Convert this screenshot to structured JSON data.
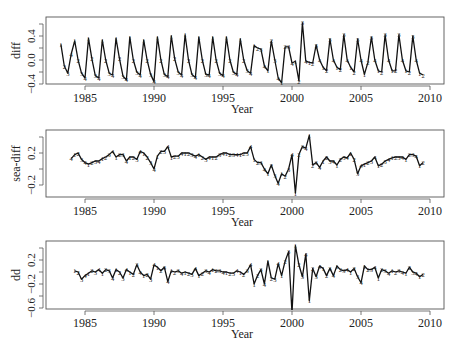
{
  "chart_data": [
    {
      "type": "line",
      "title": "",
      "xlabel": "Year",
      "ylabel": "diff",
      "xlim": [
        1983.0,
        2011.0
      ],
      "ylim": [
        -0.42,
        0.52
      ],
      "xticks": [
        1985,
        1990,
        1995,
        2000,
        2005,
        2010
      ],
      "yticks": [
        -0.4,
        0.0,
        0.4
      ],
      "ytick_labels": [
        "-0.4",
        "0.0",
        "0.4"
      ],
      "grid": false,
      "point_symbol": "quarter number (1-4)",
      "series": [
        {
          "name": "diff",
          "x": [
            1983.25,
            1983.5,
            1983.75,
            1984.0,
            1984.25,
            1984.5,
            1984.75,
            1985.0,
            1985.25,
            1985.5,
            1985.75,
            1986.0,
            1986.25,
            1986.5,
            1986.75,
            1987.0,
            1987.25,
            1987.5,
            1987.75,
            1988.0,
            1988.25,
            1988.5,
            1988.75,
            1989.0,
            1989.25,
            1989.5,
            1989.75,
            1990.0,
            1990.25,
            1990.5,
            1990.75,
            1991.0,
            1991.25,
            1991.5,
            1991.75,
            1992.0,
            1992.25,
            1992.5,
            1992.75,
            1993.0,
            1993.25,
            1993.5,
            1993.75,
            1994.0,
            1994.25,
            1994.5,
            1994.75,
            1995.0,
            1995.25,
            1995.5,
            1995.75,
            1996.0,
            1996.25,
            1996.5,
            1996.75,
            1997.0,
            1997.25,
            1997.5,
            1997.75,
            1998.0,
            1998.25,
            1998.5,
            1998.75,
            1999.0,
            1999.25,
            1999.5,
            1999.75,
            2000.0,
            2000.25,
            2000.5,
            2000.75,
            2001.0,
            2001.25,
            2001.5,
            2001.75,
            2002.0,
            2002.25,
            2002.5,
            2002.75,
            2003.0,
            2003.25,
            2003.5,
            2003.75,
            2004.0,
            2004.25,
            2004.5,
            2004.75,
            2005.0,
            2005.25,
            2005.5,
            2005.75,
            2006.0,
            2006.25,
            2006.5,
            2006.75,
            2007.0,
            2007.25,
            2007.5,
            2007.75,
            2008.0,
            2008.25,
            2008.5,
            2008.75,
            2009.0,
            2009.25,
            2009.5
          ],
          "values": [
            0.26,
            -0.1,
            -0.22,
            0.1,
            0.32,
            0.0,
            -0.22,
            -0.3,
            0.36,
            0.02,
            -0.26,
            -0.3,
            0.33,
            0.0,
            -0.22,
            -0.25,
            0.36,
            0.02,
            -0.27,
            -0.33,
            0.38,
            0.0,
            -0.2,
            -0.25,
            0.33,
            0.0,
            -0.24,
            -0.36,
            0.38,
            0.0,
            -0.24,
            -0.28,
            0.4,
            0.02,
            -0.2,
            -0.25,
            0.42,
            0.0,
            -0.24,
            -0.29,
            0.38,
            0.0,
            -0.24,
            -0.25,
            0.38,
            0.0,
            -0.22,
            -0.26,
            0.38,
            0.0,
            -0.2,
            -0.24,
            0.35,
            0.0,
            -0.18,
            -0.22,
            0.24,
            0.2,
            0.18,
            -0.1,
            -0.18,
            0.32,
            0.0,
            -0.3,
            -0.38,
            0.22,
            0.22,
            -0.05,
            -0.02,
            -0.35,
            0.62,
            -0.02,
            -0.04,
            -0.05,
            0.25,
            0.0,
            -0.12,
            -0.18,
            0.35,
            0.0,
            -0.12,
            -0.16,
            0.42,
            0.0,
            -0.12,
            -0.2,
            0.35,
            0.0,
            -0.24,
            -0.04,
            0.38,
            0.0,
            -0.18,
            -0.2,
            0.42,
            0.0,
            -0.18,
            -0.18,
            0.42,
            0.0,
            -0.18,
            -0.2,
            0.4,
            0.0,
            -0.22,
            -0.25,
            0.36,
            -0.1
          ]
        }
      ]
    },
    {
      "type": "line",
      "title": "",
      "xlabel": "Year",
      "ylabel": "sea-diff",
      "xlim": [
        1983.0,
        2011.0
      ],
      "ylim": [
        -0.33,
        0.47
      ],
      "xticks": [
        1985,
        1990,
        1995,
        2000,
        2005,
        2010
      ],
      "yticks": [
        -0.2,
        0.2
      ],
      "ytick_labels": [
        "-0.2",
        "0.2"
      ],
      "grid": false,
      "point_symbol": "quarter number (1-4)",
      "series": [
        {
          "name": "sea-diff",
          "x": [
            1984.0,
            1984.25,
            1984.5,
            1984.75,
            1985.0,
            1985.25,
            1985.5,
            1985.75,
            1986.0,
            1986.25,
            1986.5,
            1986.75,
            1987.0,
            1987.25,
            1987.5,
            1987.75,
            1988.0,
            1988.25,
            1988.5,
            1988.75,
            1989.0,
            1989.25,
            1989.5,
            1989.75,
            1990.0,
            1990.25,
            1990.5,
            1990.75,
            1991.0,
            1991.25,
            1991.5,
            1991.75,
            1992.0,
            1992.25,
            1992.5,
            1992.75,
            1993.0,
            1993.25,
            1993.5,
            1993.75,
            1994.0,
            1994.25,
            1994.5,
            1994.75,
            1995.0,
            1995.25,
            1995.5,
            1995.75,
            1996.0,
            1996.25,
            1996.5,
            1996.75,
            1997.0,
            1997.25,
            1997.5,
            1997.75,
            1998.0,
            1998.25,
            1998.5,
            1998.75,
            1999.0,
            1999.25,
            1999.5,
            1999.75,
            2000.0,
            2000.25,
            2000.5,
            2000.75,
            2001.0,
            2001.25,
            2001.5,
            2001.75,
            2002.0,
            2002.25,
            2002.5,
            2002.75,
            2003.0,
            2003.25,
            2003.5,
            2003.75,
            2004.0,
            2004.25,
            2004.5,
            2004.75,
            2005.0,
            2005.25,
            2005.5,
            2005.75,
            2006.0,
            2006.25,
            2006.5,
            2006.75,
            2007.0,
            2007.25,
            2007.5,
            2007.75,
            2008.0,
            2008.25,
            2008.5,
            2008.75,
            2009.0,
            2009.25,
            2009.5
          ],
          "values": [
            0.13,
            0.18,
            0.2,
            0.12,
            0.08,
            0.06,
            0.08,
            0.1,
            0.1,
            0.13,
            0.15,
            0.18,
            0.22,
            0.15,
            0.18,
            0.18,
            0.1,
            0.15,
            0.15,
            0.12,
            0.22,
            0.2,
            0.15,
            0.08,
            0.0,
            0.16,
            0.22,
            0.22,
            0.28,
            0.15,
            0.16,
            0.16,
            0.2,
            0.2,
            0.2,
            0.18,
            0.16,
            0.18,
            0.15,
            0.12,
            0.15,
            0.15,
            0.15,
            0.18,
            0.2,
            0.2,
            0.18,
            0.18,
            0.18,
            0.18,
            0.2,
            0.2,
            0.28,
            0.12,
            0.08,
            0.08,
            0.0,
            -0.06,
            0.05,
            -0.08,
            -0.18,
            -0.06,
            -0.09,
            0.0,
            0.18,
            -0.3,
            0.18,
            0.28,
            0.26,
            0.42,
            0.05,
            0.08,
            0.02,
            0.1,
            0.15,
            0.1,
            0.1,
            0.05,
            0.12,
            0.15,
            0.14,
            0.2,
            0.12,
            -0.06,
            0.04,
            0.06,
            0.08,
            0.1,
            0.15,
            0.04,
            0.06,
            0.1,
            0.12,
            0.14,
            0.15,
            0.15,
            0.15,
            0.12,
            0.18,
            0.18,
            0.16,
            0.04,
            0.08
          ]
        }
      ]
    },
    {
      "type": "line",
      "title": "",
      "xlabel": "Year",
      "ylabel": "dd",
      "xlim": [
        1983.0,
        2011.0
      ],
      "ylim": [
        -0.68,
        0.46
      ],
      "xticks": [
        1985,
        1990,
        1995,
        2000,
        2005,
        2010
      ],
      "yticks": [
        -0.6,
        -0.2,
        0.2
      ],
      "ytick_labels": [
        "-0.6",
        "-0.2",
        "0.2"
      ],
      "grid": false,
      "point_symbol": "quarter number (1-4)",
      "series": [
        {
          "name": "dd",
          "x": [
            1984.25,
            1984.5,
            1984.75,
            1985.0,
            1985.25,
            1985.5,
            1985.75,
            1986.0,
            1986.25,
            1986.5,
            1986.75,
            1987.0,
            1987.25,
            1987.5,
            1987.75,
            1988.0,
            1988.25,
            1988.5,
            1988.75,
            1989.0,
            1989.25,
            1989.5,
            1989.75,
            1990.0,
            1990.25,
            1990.5,
            1990.75,
            1991.0,
            1991.25,
            1991.5,
            1991.75,
            1992.0,
            1992.25,
            1992.5,
            1992.75,
            1993.0,
            1993.25,
            1993.5,
            1993.75,
            1994.0,
            1994.25,
            1994.5,
            1994.75,
            1995.0,
            1995.25,
            1995.5,
            1995.75,
            1996.0,
            1996.25,
            1996.5,
            1996.75,
            1997.0,
            1997.25,
            1997.5,
            1997.75,
            1998.0,
            1998.25,
            1998.5,
            1998.75,
            1999.0,
            1999.25,
            1999.5,
            1999.75,
            2000.0,
            2000.25,
            2000.5,
            2000.75,
            2001.0,
            2001.25,
            2001.5,
            2001.75,
            2002.0,
            2002.25,
            2002.5,
            2002.75,
            2003.0,
            2003.25,
            2003.5,
            2003.75,
            2004.0,
            2004.25,
            2004.5,
            2004.75,
            2005.0,
            2005.25,
            2005.5,
            2005.75,
            2006.0,
            2006.25,
            2006.5,
            2006.75,
            2007.0,
            2007.25,
            2007.5,
            2007.75,
            2008.0,
            2008.25,
            2008.5,
            2008.75,
            2009.0,
            2009.25,
            2009.5
          ],
          "values": [
            0.02,
            0.0,
            -0.12,
            -0.06,
            -0.02,
            0.02,
            0.0,
            0.04,
            -0.02,
            0.04,
            0.02,
            -0.1,
            0.04,
            0.0,
            -0.1,
            0.04,
            0.0,
            -0.04,
            0.12,
            0.0,
            -0.06,
            -0.04,
            -0.12,
            0.12,
            0.08,
            0.02,
            0.08,
            -0.16,
            0.02,
            0.0,
            0.02,
            -0.02,
            0.0,
            -0.02,
            -0.04,
            0.06,
            -0.06,
            -0.02,
            0.02,
            0.0,
            0.04,
            0.02,
            0.02,
            0.0,
            0.0,
            -0.02,
            -0.02,
            0.02,
            0.0,
            -0.04,
            0.02,
            0.12,
            -0.2,
            -0.06,
            0.04,
            -0.2,
            0.18,
            -0.1,
            -0.12,
            0.14,
            -0.06,
            0.18,
            0.34,
            -0.68,
            0.44,
            0.12,
            -0.08,
            0.3,
            -0.48,
            0.06,
            -0.08,
            0.1,
            0.06,
            -0.06,
            0.06,
            -0.06,
            0.1,
            0.04,
            0.02,
            0.04,
            0.0,
            0.06,
            -0.08,
            -0.18,
            0.1,
            0.04,
            0.04,
            0.08,
            -0.1,
            0.04,
            0.02,
            -0.02,
            0.02,
            0.0,
            0.02,
            0.0,
            -0.02,
            0.08,
            0.0,
            -0.02,
            -0.08,
            -0.04,
            0.12
          ]
        }
      ]
    }
  ],
  "panels": [
    {
      "name": "diff",
      "ylabel": "diff",
      "xlabel": "Year",
      "box": {
        "x0": 46,
        "x1": 444,
        "y0": 17,
        "y1": 84
      },
      "axis_y": 86,
      "ymap": {
        "v0": 0.0,
        "p0": 60,
        "v1": 0.4,
        "p1": 36
      },
      "yticks": [
        {
          "v": -0.4,
          "label": "-0.4"
        },
        {
          "v": 0.0,
          "label": "0.0"
        },
        {
          "v": 0.4,
          "label": "0.4"
        }
      ],
      "extra_yticks": [
        0.2,
        -0.2,
        0.6
      ]
    },
    {
      "name": "sea-diff",
      "ylabel": "sea-diff",
      "xlabel": "Year",
      "box": {
        "x0": 46,
        "x1": 444,
        "y0": 130,
        "y1": 197
      },
      "axis_y": 199,
      "ymap": {
        "v0": 0.2,
        "p0": 153,
        "v1": -0.2,
        "p1": 185
      },
      "yticks": [
        {
          "v": -0.2,
          "label": "-0.2"
        },
        {
          "v": 0.2,
          "label": "0.2"
        }
      ],
      "extra_yticks": [
        0.0,
        0.4
      ]
    },
    {
      "name": "dd",
      "ylabel": "dd",
      "xlabel": "Year",
      "box": {
        "x0": 46,
        "x1": 444,
        "y0": 241,
        "y1": 309
      },
      "axis_y": 311,
      "ymap": {
        "v0": 0.2,
        "p0": 260,
        "v1": -0.2,
        "p1": 284
      },
      "yticks": [
        {
          "v": -0.6,
          "label": "-0.6"
        },
        {
          "v": -0.2,
          "label": "-0.2"
        },
        {
          "v": 0.2,
          "label": "0.2"
        }
      ],
      "extra_yticks": [
        0.0,
        -0.4,
        0.4
      ]
    }
  ],
  "xmap": {
    "v0": 1985,
    "p0": 85,
    "v1": 2010,
    "p1": 430
  },
  "xticks": [
    1985,
    1990,
    1995,
    2000,
    2005,
    2010
  ],
  "colors": {
    "line": "#111111",
    "axis": "#555555",
    "text": "#222222"
  }
}
